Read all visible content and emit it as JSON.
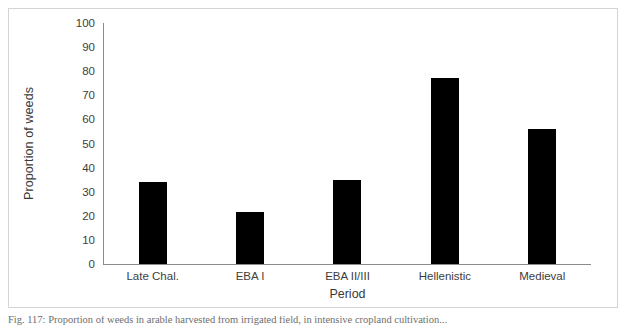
{
  "figure": {
    "caption": "Fig. 117: Proportion of weeds in arable harvested from irrigated field, in intensive cropland cultivation..."
  },
  "chart_data": {
    "type": "bar",
    "title": "",
    "xlabel": "Period",
    "ylabel": "Proportion of weeds",
    "categories": [
      "Late Chal.",
      "EBA I",
      "EBA II/III",
      "Hellenistic",
      "Medieval"
    ],
    "values": [
      34,
      21.5,
      35,
      77,
      56
    ],
    "ylim": [
      0,
      100
    ],
    "ytick_labels": [
      "100",
      "90",
      "80",
      "70",
      "60",
      "50",
      "40",
      "30",
      "20",
      "10",
      "0"
    ],
    "ytick_values": [
      100,
      90,
      80,
      70,
      60,
      50,
      40,
      30,
      20,
      10,
      0
    ],
    "grid": false,
    "legend": null,
    "bar_color": "#000000",
    "axis_color": "#8c8c8c",
    "frame_color": "#d4d4d4",
    "background": "#ffffff"
  }
}
